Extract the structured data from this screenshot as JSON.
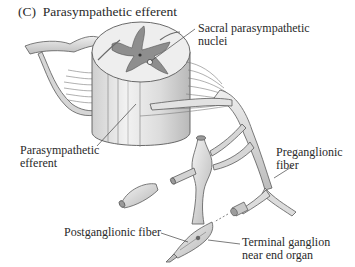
{
  "figure": {
    "panel_letter": "(C)",
    "title": "Parasympathetic efferent",
    "style": "grayscale anatomical illustration",
    "colors": {
      "background": "#ffffff",
      "text": "#2a2a2a",
      "white_matter": "#ededed",
      "gray_matter": "#8e8e8e",
      "nerve_fill": "#d8d8d8",
      "outline": "#5a5a5a"
    }
  },
  "labels": {
    "sacral_nuclei": {
      "line1": "Sacral parasympathetic",
      "line2": "nuclei"
    },
    "parasympathetic_efferent": {
      "line1": "Parasympathetic",
      "line2": "efferent"
    },
    "preganglionic": {
      "line1": "Preganglionic",
      "line2": "fiber"
    },
    "postganglionic": {
      "line1": "Postganglionic fiber"
    },
    "terminal_ganglion": {
      "line1": "Terminal ganglion",
      "line2": "near end organ"
    }
  },
  "structures": [
    "spinal-cord-segment",
    "gray-matter-butterfly",
    "sacral-parasympathetic-nucleus",
    "spinal-nerve-roots",
    "spinal-nerve-trunk",
    "sympathetic-chain-ganglion",
    "detached-ganglion",
    "preganglionic-fiber",
    "terminal-ganglion",
    "postganglionic-fiber"
  ]
}
